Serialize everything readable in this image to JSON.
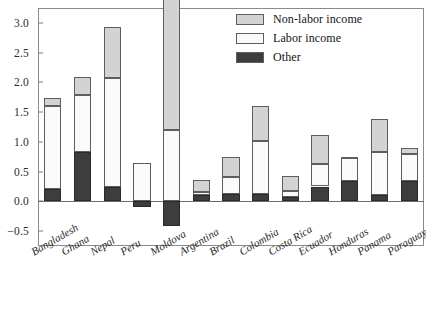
{
  "chart_data": {
    "type": "bar",
    "stacked": true,
    "orientation": "vertical",
    "title": "",
    "subtitle": "",
    "xlabel": "",
    "ylabel": "",
    "ylim": [
      -0.75,
      3.25
    ],
    "yticks": [
      -0.5,
      0.0,
      0.5,
      1.0,
      1.5,
      2.0,
      2.5,
      3.0
    ],
    "ytick_labels": [
      "−0.5",
      "0.0",
      "0.5",
      "1.0",
      "1.5",
      "2.0",
      "2.5",
      "3.0"
    ],
    "grid": false,
    "legend_position": "top-right",
    "zero_line": true,
    "categories": [
      "Bangladesh",
      "Ghana",
      "Nepal",
      "Peru",
      "Moldova",
      "Argentina",
      "Brazil",
      "Colombia",
      "Costa Rica",
      "Ecuador",
      "Honduras",
      "Panama",
      "Paraguay"
    ],
    "series": [
      {
        "name": "Other",
        "color": "#3d3d3d",
        "values": [
          0.21,
          0.83,
          0.24,
          -0.09,
          -0.41,
          0.11,
          0.12,
          0.12,
          0.07,
          0.25,
          0.35,
          0.11,
          0.35
        ]
      },
      {
        "name": "Labor income",
        "color": "#fafafa",
        "values": [
          1.39,
          0.95,
          1.84,
          0.64,
          1.2,
          0.05,
          0.29,
          0.9,
          0.1,
          0.38,
          0.39,
          0.72,
          0.44
        ]
      },
      {
        "name": "Non-labor income",
        "color": "#d3d3d3",
        "values": [
          0.13,
          0.31,
          0.85,
          0.0,
          2.62,
          0.2,
          0.33,
          0.58,
          0.25,
          0.48,
          0.01,
          0.56,
          0.11
        ]
      }
    ],
    "totals": [
      1.73,
      2.09,
      2.93,
      0.55,
      3.41,
      0.36,
      0.74,
      1.6,
      0.42,
      1.11,
      0.75,
      1.39,
      0.9
    ]
  },
  "legend": {
    "items": [
      {
        "label": "Non-labor income",
        "swatch_color": "#d3d3d3"
      },
      {
        "label": "Labor income",
        "swatch_color": "#fafafa"
      },
      {
        "label": "Other",
        "swatch_color": "#3d3d3d"
      }
    ]
  },
  "axis": {
    "y_tick_labels": [
      "3.0",
      "2.5",
      "2.0",
      "1.5",
      "1.0",
      "0.5",
      "0.0",
      "−0.5"
    ],
    "x_tick_labels": [
      "Bangladesh",
      "Ghana",
      "Nepal",
      "Peru",
      "Moldova",
      "Argentina",
      "Brazil",
      "Colombia",
      "Costa Rica",
      "Ecuador",
      "Honduras",
      "Panama",
      "Paraguay"
    ]
  }
}
